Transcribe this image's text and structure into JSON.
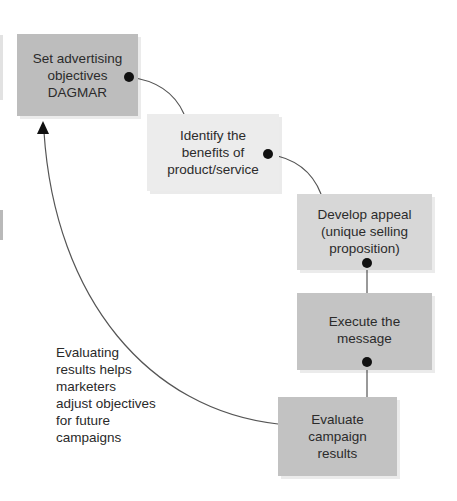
{
  "diagram": {
    "type": "advertising-campaign-process-cycle",
    "steps": [
      {
        "id": "objectives",
        "lines": [
          "Set advertising",
          "objectives",
          "DAGMAR"
        ],
        "color": "#bdbdbd"
      },
      {
        "id": "benefits",
        "lines": [
          "Identify the",
          "benefits of",
          "product/service"
        ],
        "color": "#ececec"
      },
      {
        "id": "appeal",
        "lines": [
          "Develop appeal",
          "(unique selling",
          "proposition)"
        ],
        "color": "#d7d7d7"
      },
      {
        "id": "execute",
        "lines": [
          "Execute the",
          "message"
        ],
        "color": "#c4c4c4"
      },
      {
        "id": "evaluate",
        "lines": [
          "Evaluate",
          "campaign",
          "results"
        ],
        "color": "#c2c2c2"
      }
    ],
    "feedback_note": {
      "lines": [
        "Evaluating",
        "results helps",
        "marketers",
        "adjust objectives",
        "for future",
        "campaigns"
      ]
    },
    "connector_color": "#555555",
    "dot_color": "#111111"
  }
}
